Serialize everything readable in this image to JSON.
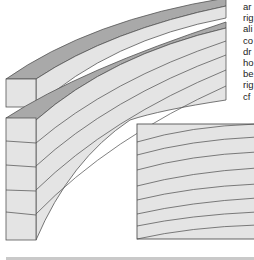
{
  "figure": {
    "colors": {
      "face": "#e4e4e4",
      "top_face": "#a9a9a9",
      "outline": "#555555",
      "lamination_line": "#4a4a4a"
    },
    "top_strip_count": 1,
    "laminate_layers": 5,
    "inset_lines": 8
  },
  "side_text": {
    "lines": [
      "ar",
      "rig",
      "ali",
      "co",
      "dr",
      "ho",
      "be",
      "rig",
      "cf"
    ]
  }
}
